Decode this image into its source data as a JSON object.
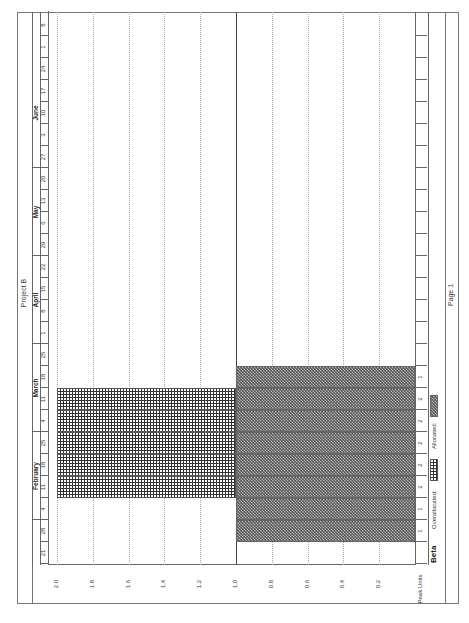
{
  "header": {
    "title": "Project B"
  },
  "footer": {
    "page_label": "Page 1"
  },
  "timescale": {
    "months": [
      {
        "label": "February",
        "x": 103,
        "w": 88
      },
      {
        "label": "March",
        "x": 191,
        "w": 88
      },
      {
        "label": "April",
        "x": 279,
        "w": 88
      },
      {
        "label": "May",
        "x": 367,
        "w": 88
      },
      {
        "label": "June",
        "x": 455,
        "w": 110
      }
    ],
    "weeks": [
      "21",
      "28",
      "4",
      "11",
      "18",
      "25",
      "4",
      "11",
      "18",
      "25",
      "1",
      "8",
      "15",
      "22",
      "29",
      "6",
      "13",
      "20",
      "27",
      "3",
      "10",
      "17",
      "24",
      "1",
      "8"
    ]
  },
  "resource": {
    "name": "Beta",
    "axis_label": "Peak Units"
  },
  "legend": {
    "overallocated_label": "Overallocated:",
    "allocated_label": "Allocated:"
  },
  "row_values": [
    "",
    "1",
    "1",
    "2",
    "2",
    "2",
    "2",
    "2",
    "1",
    "",
    "",
    "",
    "",
    "",
    "",
    "",
    "",
    "",
    "",
    "",
    "",
    "",
    "",
    "",
    ""
  ],
  "chart_data": {
    "type": "bar",
    "title": "Project B",
    "subtitle": "Beta",
    "xlabel": "Week (timescale)",
    "ylabel": "Peak Units",
    "ylim": [
      0,
      2.0
    ],
    "yticks": [
      "2.0",
      "1.8",
      "1.6",
      "1.4",
      "1.2",
      "1.0",
      "0.8",
      "0.6",
      "0.4",
      "0.2"
    ],
    "categories": [
      "Jan 21",
      "Jan 28",
      "Feb 4",
      "Feb 11",
      "Feb 18",
      "Feb 25",
      "Mar 4",
      "Mar 11",
      "Mar 18",
      "Mar 25",
      "Apr 1",
      "Apr 8",
      "Apr 15",
      "Apr 22",
      "Apr 29",
      "May 6",
      "May 13",
      "May 20",
      "May 27",
      "Jun 3",
      "Jun 10",
      "Jun 17",
      "Jun 24",
      "Jul 1",
      "Jul 8"
    ],
    "series": [
      {
        "name": "Allocated",
        "values": [
          0,
          1,
          1,
          1,
          1,
          1,
          1,
          1,
          1,
          0,
          0,
          0,
          0,
          0,
          0,
          0,
          0,
          0,
          0,
          0,
          0,
          0,
          0,
          0,
          0
        ]
      },
      {
        "name": "Overallocated",
        "values": [
          0,
          0,
          0,
          1,
          1,
          1,
          1,
          1,
          0,
          0,
          0,
          0,
          0,
          0,
          0,
          0,
          0,
          0,
          0,
          0,
          0,
          0,
          0,
          0,
          0
        ]
      }
    ],
    "peak_units": [
      0,
      1,
      1,
      2,
      2,
      2,
      2,
      2,
      1,
      0,
      0,
      0,
      0,
      0,
      0,
      0,
      0,
      0,
      0,
      0,
      0,
      0,
      0,
      0,
      0
    ],
    "max_units_line": 1.0,
    "legend_position": "bottom",
    "grid": true,
    "colors": {
      "allocated": "#555555",
      "overallocated": "#333333"
    }
  }
}
